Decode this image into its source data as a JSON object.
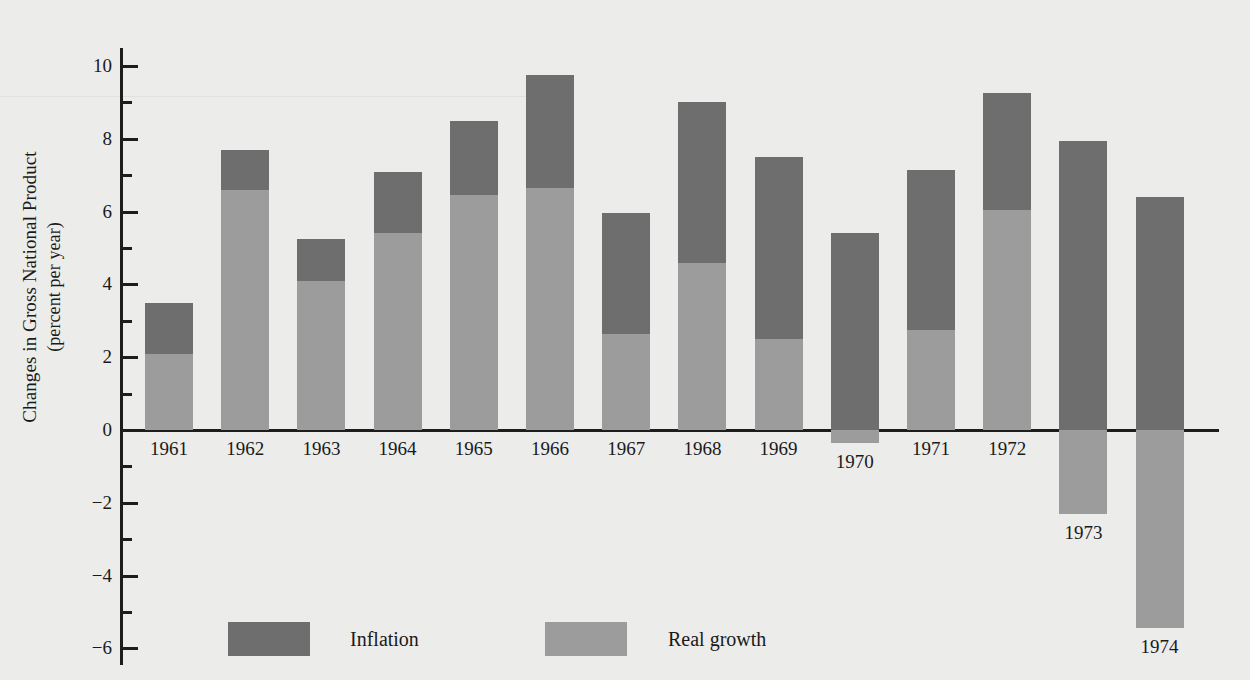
{
  "chart_data": {
    "type": "bar",
    "subtype": "stacked-bar-with-negatives",
    "title": "",
    "xlabel": "",
    "ylabel": "Changes in Gross National Product (percent per year)",
    "ylabel_line1": "Changes in Gross National Product",
    "ylabel_line2": "(percent per year)",
    "ylim": [
      -6,
      10
    ],
    "ytick_major": [
      10,
      8,
      6,
      4,
      2,
      0,
      -2,
      -4,
      -6
    ],
    "ytick_major_labels": [
      "10",
      "8",
      "6",
      "4",
      "2",
      "0",
      "−2",
      "−4",
      "−6"
    ],
    "ytick_minor": [
      9,
      7,
      5,
      3,
      1,
      -1,
      -3,
      -5
    ],
    "grid": false,
    "legend_position": "bottom",
    "categories": [
      "1961",
      "1962",
      "1963",
      "1964",
      "1965",
      "1966",
      "1967",
      "1968",
      "1969",
      "1970",
      "1971",
      "1972",
      "1973",
      "1974"
    ],
    "series": [
      {
        "name": "Real growth",
        "color": "#9c9c9c",
        "values": [
          2.1,
          6.6,
          4.1,
          5.4,
          6.45,
          6.65,
          2.65,
          4.6,
          2.5,
          -0.35,
          2.75,
          6.05,
          -2.3,
          -5.45
        ]
      },
      {
        "name": "Inflation",
        "color": "#6e6e6e",
        "values": [
          1.4,
          1.1,
          1.15,
          1.7,
          2.05,
          3.1,
          3.3,
          4.4,
          5.0,
          5.4,
          4.4,
          3.2,
          7.95,
          6.4
        ]
      }
    ],
    "totals": [
      3.5,
      7.7,
      5.25,
      7.1,
      8.5,
      9.75,
      5.95,
      9.0,
      7.5,
      5.05,
      7.15,
      9.25,
      5.65,
      0.95
    ]
  },
  "legend": {
    "items": [
      {
        "label": "Inflation",
        "color": "#6e6e6e"
      },
      {
        "label": "Real growth",
        "color": "#9c9c9c"
      }
    ]
  },
  "colors": {
    "background": "#ececeb",
    "axis": "#1d1d1d",
    "inflation": "#6e6e6e",
    "real_growth": "#9c9c9c"
  }
}
